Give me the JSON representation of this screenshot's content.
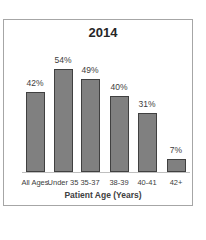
{
  "chart_data": {
    "type": "bar",
    "title": "2014",
    "xlabel": "Patient Age (Years)",
    "ylabel": "",
    "categories": [
      "All Ages",
      "Under 35",
      "35-37",
      "38-39",
      "40-41",
      "42+"
    ],
    "values": [
      42,
      54,
      49,
      40,
      31,
      7
    ],
    "value_labels": [
      "42%",
      "54%",
      "49%",
      "40%",
      "31%",
      "7%"
    ],
    "ylim": [
      0,
      60
    ],
    "grid": false,
    "legend": "none",
    "bar_color": "#808080"
  }
}
